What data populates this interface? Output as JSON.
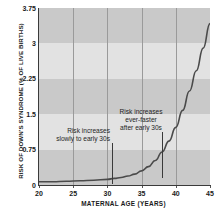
{
  "chart_data": {
    "type": "line",
    "title": "",
    "xlabel": "MATERNAL AGE (YEARS)",
    "ylabel": "RISK OF DOWN'S SYNDROME (% OF LIVE BIRTHS)",
    "xlim": [
      20,
      45
    ],
    "ylim": [
      0,
      3.75
    ],
    "xticks": [
      20,
      25,
      30,
      35,
      40,
      45
    ],
    "xtick_labels": [
      "20",
      "25",
      "30",
      "35",
      "40",
      "45"
    ],
    "yticks": [
      0,
      0.75,
      1.5,
      2.25,
      3,
      3.75
    ],
    "ytick_labels": [
      "0",
      "0.75",
      "1.5",
      "2.25",
      "3",
      "3.75"
    ],
    "grid": "vertical gridlines at each x tick; alternating horizontal shaded bands every 0.75 units",
    "legend": "none",
    "series": [
      {
        "name": "Risk of Down's syndrome",
        "color": "#4a4a4a",
        "x": [
          20,
          22,
          24,
          26,
          28,
          30,
          31,
          32,
          33,
          34,
          35,
          36,
          37,
          38,
          39,
          40,
          41,
          42,
          43,
          44,
          45
        ],
        "y": [
          0.07,
          0.07,
          0.08,
          0.09,
          0.1,
          0.12,
          0.14,
          0.16,
          0.19,
          0.23,
          0.3,
          0.39,
          0.52,
          0.7,
          0.93,
          1.22,
          1.58,
          1.99,
          2.42,
          2.9,
          3.42
        ]
      }
    ],
    "annotations": [
      {
        "id": "annotation-left",
        "line1": "Risk increases",
        "line2": "slowly to early 30s",
        "leader_x_value": 30.7
      },
      {
        "id": "annotation-right",
        "line1": "Risk increases",
        "line2": "ever-faster",
        "line3": "after early 30s",
        "leader_x_value": 38.0
      }
    ],
    "band_colors": {
      "dark": "#c9c9c9",
      "light": "#e2e2e2"
    },
    "axis_color": "#3a3a3a"
  }
}
